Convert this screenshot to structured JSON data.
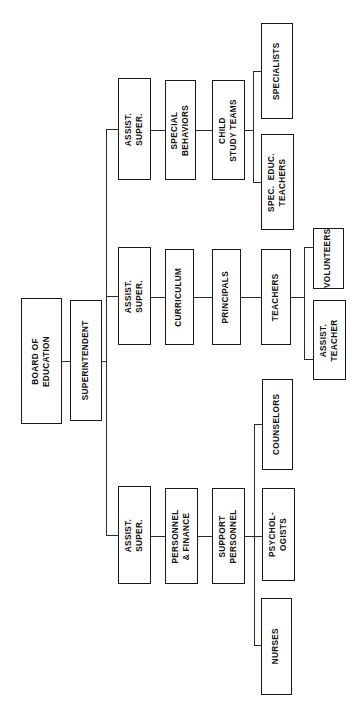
{
  "chart": {
    "orientation": "rotated-90-ccw",
    "background_color": "#ffffff",
    "line_color": "#2b2b2b",
    "box_border_color": "#1a1a1a",
    "text_color": "#111111",
    "nodes": [
      {
        "id": "board",
        "label": "BOARD OF\nEDUCATION",
        "x": 21,
        "y": 298,
        "w": 41,
        "h": 126
      },
      {
        "id": "superintendent",
        "label": "SUPERINTENDENT",
        "x": 70,
        "y": 300,
        "w": 32,
        "h": 121
      },
      {
        "id": "assist_super_1",
        "label": "ASSIST.\nSUPER.",
        "x": 118,
        "y": 78,
        "w": 33,
        "h": 102
      },
      {
        "id": "special_behaviors",
        "label": "SPECIAL\nBEHAVIORS",
        "x": 165,
        "y": 80,
        "w": 31,
        "h": 100
      },
      {
        "id": "child_study",
        "label": "CHILD\nSTUDY TEAMS",
        "x": 212,
        "y": 80,
        "w": 33,
        "h": 100
      },
      {
        "id": "specialists",
        "label": "SPECIALISTS",
        "x": 261,
        "y": 23,
        "w": 32,
        "h": 96
      },
      {
        "id": "spec_educ",
        "label": "SPEC.  EDUC.\nTEACHERS",
        "x": 261,
        "y": 134,
        "w": 33,
        "h": 96
      },
      {
        "id": "assist_super_2",
        "label": "ASSIST.\nSUPER.",
        "x": 118,
        "y": 247,
        "w": 33,
        "h": 98
      },
      {
        "id": "curriculum",
        "label": "CURRICULUM",
        "x": 165,
        "y": 249,
        "w": 29,
        "h": 96
      },
      {
        "id": "principals",
        "label": "PRINCIPALS",
        "x": 212,
        "y": 249,
        "w": 29,
        "h": 96
      },
      {
        "id": "teachers",
        "label": "TEACHERS",
        "x": 261,
        "y": 249,
        "w": 30,
        "h": 96
      },
      {
        "id": "volunteers",
        "label": "VOLUNTEERS",
        "x": 313,
        "y": 228,
        "w": 31,
        "h": 61
      },
      {
        "id": "assist_teacher",
        "label": "ASSIST.\nTEACHER",
        "x": 313,
        "y": 300,
        "w": 33,
        "h": 80
      },
      {
        "id": "assist_super_3",
        "label": "ASSIST.\nSUPER.",
        "x": 118,
        "y": 486,
        "w": 33,
        "h": 98
      },
      {
        "id": "personnel",
        "label": "PERSONNEL\n& FINANCE",
        "x": 165,
        "y": 488,
        "w": 33,
        "h": 96
      },
      {
        "id": "support",
        "label": "SUPPORT\nPERSONNEL",
        "x": 212,
        "y": 488,
        "w": 33,
        "h": 96
      },
      {
        "id": "counselors",
        "label": "COUNSELORS",
        "x": 262,
        "y": 379,
        "w": 31,
        "h": 91
      },
      {
        "id": "psychologists",
        "label": "PSYCHOL-\nOGISTS",
        "x": 262,
        "y": 488,
        "w": 33,
        "h": 93
      },
      {
        "id": "nurses",
        "label": "NURSES",
        "x": 261,
        "y": 598,
        "w": 31,
        "h": 97
      }
    ],
    "connectors": [
      {
        "id": "board-to-superintendent",
        "type": "h",
        "x": 62,
        "y": 361,
        "w": 8,
        "h": 0
      },
      {
        "id": "superintendent-to-trunk",
        "type": "h",
        "x": 102,
        "y": 361,
        "w": 5,
        "h": 0
      },
      {
        "id": "trunk-vertical",
        "type": "v",
        "x": 106,
        "y": 129,
        "w": 0,
        "h": 406
      },
      {
        "id": "trunk-to-assist-super-1",
        "type": "h",
        "x": 106,
        "y": 129,
        "w": 13,
        "h": 0
      },
      {
        "id": "trunk-to-assist-super-2",
        "type": "h",
        "x": 106,
        "y": 296,
        "w": 13,
        "h": 0
      },
      {
        "id": "trunk-to-assist-super-3",
        "type": "h",
        "x": 106,
        "y": 535,
        "w": 13,
        "h": 0
      },
      {
        "id": "assist1-to-special-behaviors",
        "type": "h",
        "x": 151,
        "y": 130,
        "w": 15,
        "h": 0
      },
      {
        "id": "special-behaviors-to-child",
        "type": "h",
        "x": 196,
        "y": 130,
        "w": 17,
        "h": 0
      },
      {
        "id": "child-to-split",
        "type": "h",
        "x": 245,
        "y": 130,
        "w": 9,
        "h": 0
      },
      {
        "id": "child-split-vertical",
        "type": "v",
        "x": 253,
        "y": 71,
        "w": 0,
        "h": 112
      },
      {
        "id": "split-to-specialists",
        "type": "h",
        "x": 253,
        "y": 71,
        "w": 9,
        "h": 0
      },
      {
        "id": "split-to-spec-educ",
        "type": "h",
        "x": 253,
        "y": 182,
        "w": 9,
        "h": 0
      },
      {
        "id": "assist2-to-curriculum",
        "type": "h",
        "x": 151,
        "y": 297,
        "w": 15,
        "h": 0
      },
      {
        "id": "curriculum-to-principals",
        "type": "h",
        "x": 194,
        "y": 297,
        "w": 19,
        "h": 0
      },
      {
        "id": "principals-to-teachers",
        "type": "h",
        "x": 241,
        "y": 297,
        "w": 21,
        "h": 0
      },
      {
        "id": "teachers-to-split",
        "type": "h",
        "x": 291,
        "y": 297,
        "w": 14,
        "h": 0
      },
      {
        "id": "teachers-split-vertical",
        "type": "v",
        "x": 304,
        "y": 247,
        "w": 0,
        "h": 113
      },
      {
        "id": "split-to-volunteers",
        "type": "h",
        "x": 304,
        "y": 247,
        "w": 10,
        "h": 0
      },
      {
        "id": "split-to-assist-teacher",
        "type": "h",
        "x": 304,
        "y": 359,
        "w": 10,
        "h": 0
      },
      {
        "id": "assist3-to-personnel",
        "type": "h",
        "x": 151,
        "y": 536,
        "w": 15,
        "h": 0
      },
      {
        "id": "personnel-to-support",
        "type": "h",
        "x": 198,
        "y": 536,
        "w": 15,
        "h": 0
      },
      {
        "id": "support-to-split",
        "type": "h",
        "x": 245,
        "y": 536,
        "w": 10,
        "h": 0
      },
      {
        "id": "support-split-vertical",
        "type": "v",
        "x": 254,
        "y": 424,
        "w": 0,
        "h": 222
      },
      {
        "id": "split-to-counselors",
        "type": "h",
        "x": 254,
        "y": 424,
        "w": 9,
        "h": 0
      },
      {
        "id": "split-to-psychologists",
        "type": "h",
        "x": 254,
        "y": 536,
        "w": 9,
        "h": 0
      },
      {
        "id": "split-to-nurses",
        "type": "h",
        "x": 254,
        "y": 645,
        "w": 8,
        "h": 0
      }
    ]
  }
}
